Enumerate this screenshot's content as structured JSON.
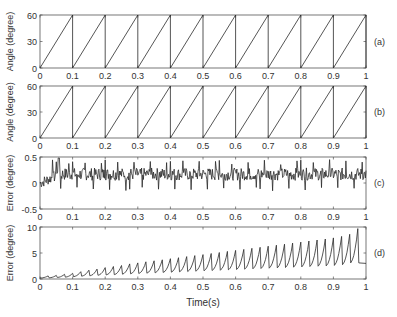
{
  "figure": {
    "xlabel": "Time(s)",
    "x_ticks": [
      "0",
      "0.1",
      "0.2",
      "0.3",
      "0.4",
      "0.5",
      "0.6",
      "0.7",
      "0.8",
      "0.9",
      "1"
    ],
    "line_color": "#2a2a2a",
    "axis_color": "#555555"
  },
  "chart_data": [
    {
      "type": "line",
      "panel_label": "(a)",
      "title": "",
      "xlabel": "",
      "ylabel": "Angle (degree)",
      "xlim": [
        0,
        1
      ],
      "ylim": [
        0,
        60
      ],
      "y_ticks": [
        0,
        30,
        60
      ],
      "y_tick_labels": [
        "0",
        "30",
        "60"
      ],
      "grid": false,
      "description": "Sawtooth angle ramping 0 to 60 degrees every 0.1 s",
      "series": [
        {
          "name": "angle",
          "shape": "sawtooth",
          "period": 0.1,
          "min": 0,
          "max": 60
        }
      ]
    },
    {
      "type": "line",
      "panel_label": "(b)",
      "title": "",
      "xlabel": "",
      "ylabel": "Angle (degree)",
      "xlim": [
        0,
        1
      ],
      "ylim": [
        0,
        60
      ],
      "y_ticks": [
        0,
        30,
        60
      ],
      "y_tick_labels": [
        "0",
        "30",
        "60"
      ],
      "grid": false,
      "description": "Sawtooth angle ramping 0 to 60 degrees every 0.1 s",
      "series": [
        {
          "name": "angle",
          "shape": "sawtooth",
          "period": 0.1,
          "min": 0,
          "max": 60
        }
      ]
    },
    {
      "type": "line",
      "panel_label": "(c)",
      "title": "",
      "xlabel": "",
      "ylabel": "Error (degree)",
      "xlim": [
        0,
        1
      ],
      "ylim": [
        -0.5,
        0.5
      ],
      "y_ticks": [
        -0.5,
        0,
        0.5
      ],
      "y_tick_labels": [
        "-0.5",
        "0",
        "0.5"
      ],
      "grid": false,
      "description": "Noisy error oscillating around ~0.15 after initial transient near 0, peaks ~0.4, dips ~-0.1",
      "series": [
        {
          "name": "error",
          "shape": "noise",
          "mean_initial": 0.0,
          "mean_steady": 0.17,
          "amplitude": 0.12,
          "spike_period": 0.0125,
          "spike_max": 0.45,
          "spike_min": -0.15
        }
      ]
    },
    {
      "type": "line",
      "panel_label": "(d)",
      "title": "",
      "xlabel": "Time(s)",
      "ylabel": "Error (degree)",
      "xlim": [
        0,
        1
      ],
      "ylim": [
        0,
        10
      ],
      "y_ticks": [
        0,
        5,
        10
      ],
      "y_tick_labels": [
        "0",
        "5",
        "10"
      ],
      "grid": false,
      "description": "Sawtooth-like error with period 0.025 s, peaks growing from ~0.5 to ~9.7",
      "series": [
        {
          "name": "error",
          "shape": "growing_sawtooth",
          "period": 0.025,
          "peaks_x": [
            0.025,
            0.05,
            0.075,
            0.1,
            0.125,
            0.15,
            0.175,
            0.2,
            0.225,
            0.25,
            0.275,
            0.3,
            0.325,
            0.35,
            0.375,
            0.4,
            0.425,
            0.45,
            0.475,
            0.5,
            0.525,
            0.55,
            0.575,
            0.6,
            0.625,
            0.65,
            0.675,
            0.7,
            0.725,
            0.75,
            0.775,
            0.8,
            0.825,
            0.85,
            0.875,
            0.9,
            0.925,
            0.95,
            0.975
          ],
          "peaks_y": [
            0.6,
            0.7,
            0.9,
            1.1,
            1.4,
            1.7,
            1.9,
            2.2,
            2.4,
            2.6,
            2.9,
            3.1,
            3.3,
            3.5,
            3.7,
            3.9,
            4.1,
            4.3,
            4.5,
            4.7,
            4.9,
            5.1,
            5.3,
            5.5,
            5.7,
            5.9,
            6.1,
            6.3,
            6.5,
            6.7,
            6.9,
            7.1,
            7.3,
            7.5,
            7.7,
            7.9,
            8.2,
            8.6,
            9.7
          ],
          "troughs_y_range": [
            0.2,
            3.0
          ]
        }
      ]
    }
  ]
}
